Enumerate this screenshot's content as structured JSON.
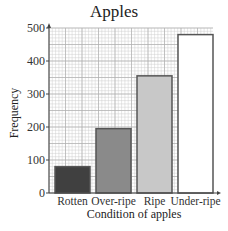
{
  "chart_data": {
    "type": "bar",
    "title": "Apples",
    "xlabel": "Condition of apples",
    "ylabel": "Frequency",
    "categories": [
      "Rotten",
      "Over-ripe",
      "Ripe",
      "Under-ripe"
    ],
    "values": [
      80,
      195,
      355,
      480
    ],
    "bar_colors": [
      "#404040",
      "#8a8a8a",
      "#c8c8c8",
      "#ffffff"
    ],
    "yticks": [
      0,
      100,
      200,
      300,
      400,
      500
    ],
    "ylim": [
      0,
      500
    ],
    "grid": true,
    "legend": null
  }
}
